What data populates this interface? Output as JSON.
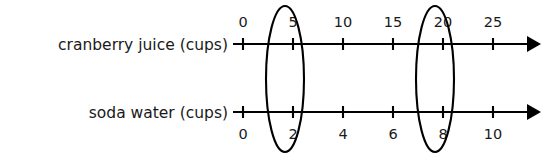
{
  "diagram": {
    "type": "double-number-line",
    "background_color": "#ffffff",
    "line_color": "#000000",
    "text_color": "#1a1a1a"
  },
  "lines": [
    {
      "name": "cranberry-juice",
      "label": "cranberry juice (cups)",
      "labels_position": "above",
      "axis_y": 44,
      "ticks": [
        {
          "value": "0",
          "x": 243
        },
        {
          "value": "5",
          "x": 293
        },
        {
          "value": "10",
          "x": 343
        },
        {
          "value": "15",
          "x": 393
        },
        {
          "value": "20",
          "x": 443
        },
        {
          "value": "25",
          "x": 493
        }
      ]
    },
    {
      "name": "soda-water",
      "label": "soda water (cups)",
      "labels_position": "below",
      "axis_y": 112,
      "ticks": [
        {
          "value": "0",
          "x": 243
        },
        {
          "value": "2",
          "x": 293
        },
        {
          "value": "4",
          "x": 343
        },
        {
          "value": "6",
          "x": 393
        },
        {
          "value": "8",
          "x": 443
        },
        {
          "value": "10",
          "x": 493
        }
      ]
    }
  ],
  "circled_pairs": [
    {
      "name": "pair-5-2",
      "cranberry": "5",
      "soda": "2",
      "cx": 285,
      "cy": 79,
      "rx": 19,
      "ry": 73
    },
    {
      "name": "pair-20-8",
      "cranberry": "20",
      "soda": "8",
      "cx": 435,
      "cy": 79,
      "rx": 19,
      "ry": 73
    }
  ],
  "axis": {
    "start_x": 233,
    "end_x": 538,
    "tick_half_height": 6
  }
}
